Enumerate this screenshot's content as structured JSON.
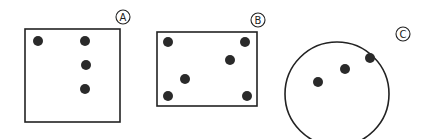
{
  "figures": [
    {
      "id": "A",
      "label": "A",
      "shape": "square",
      "box": {
        "x": 25,
        "y": 29,
        "w": 95,
        "h": 93
      },
      "label_pos": {
        "x": 123,
        "y": 17
      },
      "dots": [
        {
          "x": 38,
          "y": 41
        },
        {
          "x": 85,
          "y": 41
        },
        {
          "x": 86,
          "y": 65
        },
        {
          "x": 85,
          "y": 89
        }
      ]
    },
    {
      "id": "B",
      "label": "B",
      "shape": "rectangle",
      "box": {
        "x": 157,
        "y": 32,
        "w": 100,
        "h": 74
      },
      "label_pos": {
        "x": 258,
        "y": 20
      },
      "dots": [
        {
          "x": 168,
          "y": 42
        },
        {
          "x": 245,
          "y": 42
        },
        {
          "x": 230,
          "y": 60
        },
        {
          "x": 185,
          "y": 79
        },
        {
          "x": 168,
          "y": 96
        },
        {
          "x": 247,
          "y": 96
        }
      ]
    },
    {
      "id": "C",
      "label": "C",
      "shape": "circle",
      "circle": {
        "cx": 337,
        "cy": 94,
        "r": 52
      },
      "label_pos": {
        "x": 403,
        "y": 34
      },
      "dots": [
        {
          "x": 318,
          "y": 82
        },
        {
          "x": 345,
          "y": 69
        },
        {
          "x": 370,
          "y": 58
        }
      ]
    }
  ],
  "style": {
    "stroke": "#222222",
    "dot_fill": "#2a2a2a",
    "dot_radius": 5,
    "background": "#ffffff"
  }
}
